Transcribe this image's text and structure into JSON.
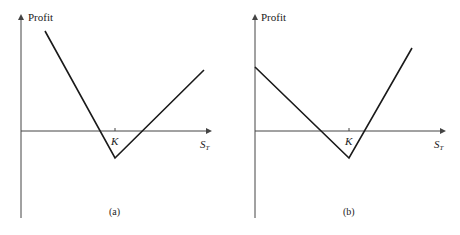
{
  "chart_data": [
    {
      "type": "line",
      "panel_label": "(a)",
      "ylabel": "Profit",
      "xlabel": "S_T",
      "xlabel_main": "S",
      "xlabel_sub": "T",
      "strike_label": "K",
      "grid": false,
      "legend": null,
      "description": "V-shaped profit: steep negative slope left of K, gentler positive slope right of K, minimum below zero at K",
      "points_px": [
        [
          45,
          31
        ],
        [
          115,
          158
        ],
        [
          204,
          70
        ]
      ],
      "x": [
        "low S_T",
        "K",
        "high S_T"
      ],
      "y_relative": [
        3.7,
        -1.0,
        2.3
      ],
      "slopes": {
        "left_of_K": -2,
        "right_of_K": 1
      }
    },
    {
      "type": "line",
      "panel_label": "(b)",
      "ylabel": "Profit",
      "xlabel": "S_T",
      "xlabel_main": "S",
      "xlabel_sub": "T",
      "strike_label": "K",
      "grid": false,
      "legend": null,
      "description": "V-shaped profit: gentle negative slope left of K, steep positive slope right of K, minimum below zero at K",
      "points_px": [
        [
          255,
          67
        ],
        [
          349,
          158
        ],
        [
          412,
          48
        ]
      ],
      "x": [
        "0",
        "K",
        "high S_T"
      ],
      "y_relative": [
        2.4,
        -1.0,
        4.0
      ],
      "slopes": {
        "left_of_K": -1,
        "right_of_K": 2
      }
    }
  ]
}
